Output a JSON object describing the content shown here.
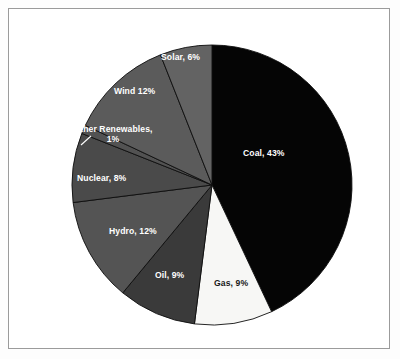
{
  "figure": {
    "background_color": "#ffffff",
    "border_color": "#9b9b9b"
  },
  "chart_data": {
    "type": "pie",
    "title": "",
    "subtitle": "",
    "xlabel": "",
    "ylabel": "",
    "legend_position": "none",
    "grid": false,
    "label_style": "inside-slice",
    "start_angle_deg": 0,
    "direction": "clockwise",
    "units": "percent",
    "total": 100,
    "categories": [
      "Coal",
      "Gas",
      "Oil",
      "Hydro",
      "Nuclear",
      "Other Renewables",
      "Wind",
      "Solar"
    ],
    "values": [
      43,
      9,
      9,
      12,
      8,
      1,
      12,
      6
    ],
    "slices": [
      {
        "name": "Coal",
        "value": 43,
        "label": "Coal, 43%",
        "color": "#050505",
        "text_color": "#ffffff",
        "start_angle": 0,
        "end_angle": 154.8
      },
      {
        "name": "Gas",
        "value": 9,
        "label": "Gas, 9%",
        "color": "#f7f7f5",
        "text_color": "#1a1a1a",
        "start_angle": 154.8,
        "end_angle": 187.2
      },
      {
        "name": "Oil",
        "value": 9,
        "label": "Oil, 9%",
        "color": "#3a3a3a",
        "text_color": "#ffffff",
        "start_angle": 187.2,
        "end_angle": 219.6
      },
      {
        "name": "Hydro",
        "value": 12,
        "label": "Hydro, 12%",
        "color": "#545454",
        "text_color": "#ffffff",
        "start_angle": 219.6,
        "end_angle": 262.8
      },
      {
        "name": "Nuclear",
        "value": 8,
        "label": "Nuclear, 8%",
        "color": "#4a4a4a",
        "text_color": "#ffffff",
        "start_angle": 262.8,
        "end_angle": 291.6
      },
      {
        "name": "Other Renewables",
        "value": 1,
        "label": "Other Renewables, 1%",
        "label_line1": "Other Renewables,",
        "label_line2": "1%",
        "color": "#525252",
        "text_color": "#ffffff",
        "start_angle": 291.6,
        "end_angle": 295.2,
        "has_leader_line": true
      },
      {
        "name": "Wind",
        "value": 12,
        "label": "Wind 12%",
        "color": "#5b5b5b",
        "text_color": "#ffffff",
        "start_angle": 295.2,
        "end_angle": 338.4
      },
      {
        "name": "Solar",
        "value": 6,
        "label": "Solar, 6%",
        "color": "#636363",
        "text_color": "#ffffff",
        "start_angle": 338.4,
        "end_angle": 360
      }
    ]
  }
}
